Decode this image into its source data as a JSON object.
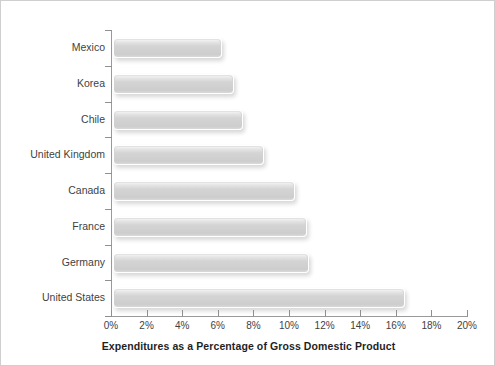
{
  "chart_data": {
    "type": "bar",
    "orientation": "horizontal",
    "title": "",
    "xlabel": "Expenditures as a Percentage of Gross Domestic Product",
    "ylabel": "",
    "categories": [
      "Mexico",
      "Korea",
      "Chile",
      "United Kingdom",
      "Canada",
      "France",
      "Germany",
      "United States"
    ],
    "values": [
      6.1,
      6.8,
      7.3,
      8.5,
      10.2,
      10.9,
      11.0,
      16.4
    ],
    "xlim": [
      0,
      20
    ],
    "xtick_values": [
      0,
      2,
      4,
      6,
      8,
      10,
      12,
      14,
      16,
      18,
      20
    ],
    "xtick_labels": [
      "0%",
      "2%",
      "4%",
      "6%",
      "8%",
      "10%",
      "12%",
      "14%",
      "16%",
      "18%",
      "20%"
    ],
    "grid": false,
    "legend": null,
    "bar_color": "#d2d2d2",
    "axis_color": "#9a9a9a",
    "text_color": "#3f3f3f"
  }
}
